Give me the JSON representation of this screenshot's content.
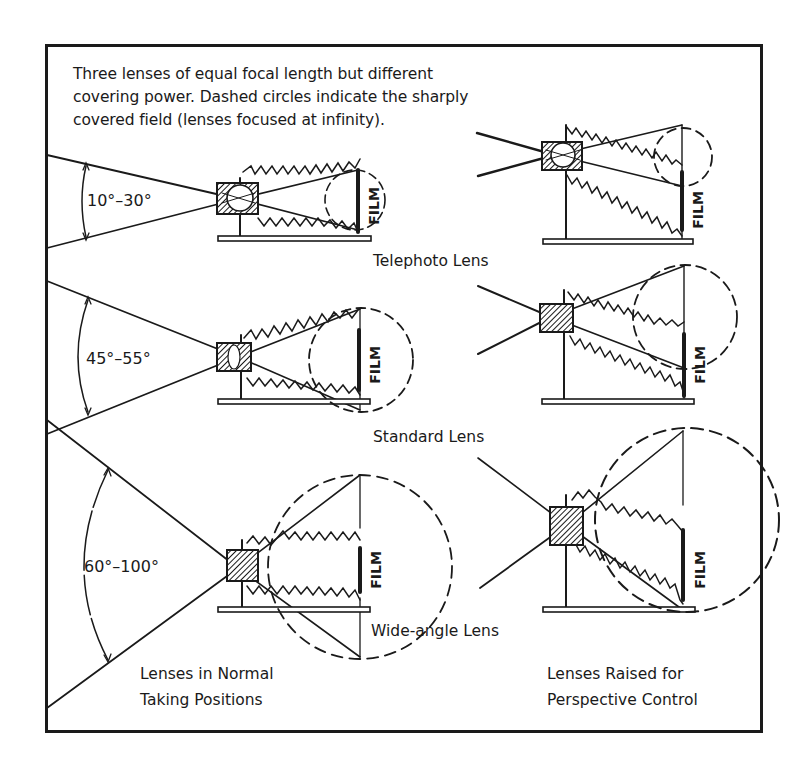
{
  "caption": {
    "line1": "Three lenses of equal focal length but different",
    "line2": "covering power. Dashed circles indicate the sharply",
    "line3": "covered field (lenses focused at infinity)."
  },
  "angles": {
    "telephoto": "10°–30°",
    "standard": "45°–55°",
    "wide": "60°–100°"
  },
  "lens_labels": {
    "telephoto": "Telephoto Lens",
    "standard": "Standard Lens",
    "wide": "Wide-angle Lens"
  },
  "film_label": "FILM",
  "footers": {
    "left_line1": "Lenses in Normal",
    "left_line2": "Taking Positions",
    "right_line1": "Lenses Raised for",
    "right_line2": "Perspective Control"
  },
  "colors": {
    "ink": "#1a1a1a",
    "paper": "#ffffff"
  }
}
